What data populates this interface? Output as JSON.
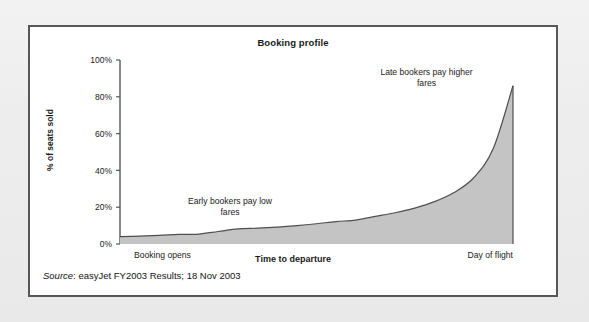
{
  "figure": {
    "title": "Booking profile",
    "source_label": "Source",
    "source_separator": ": ",
    "source_text": "easyJet FY2003 Results; 18 Nov 2003",
    "frame_color": "#555759",
    "background_color": "#ffffff",
    "page_background": "#ececec"
  },
  "chart_data": {
    "type": "area",
    "title": "Booking profile",
    "xlabel": "Time to departure",
    "ylabel": "% of seats sold",
    "ylim": [
      0,
      100
    ],
    "xlim": [
      0,
      100
    ],
    "grid": false,
    "legend": "none",
    "fill_color": "#c4c4c4",
    "line_color": "#4f4f4f",
    "axis_color": "#555759",
    "ytick_labels": [
      "0%",
      "20%",
      "40%",
      "60%",
      "80%",
      "100%"
    ],
    "ytick_values": [
      0,
      20,
      40,
      60,
      80,
      100
    ],
    "xtick_labels": [
      "Booking opens",
      "Day of flight"
    ],
    "xtick_positions": [
      0,
      100
    ],
    "x": [
      0,
      5,
      10,
      15,
      20,
      25,
      30,
      35,
      40,
      45,
      50,
      55,
      60,
      65,
      70,
      75,
      80,
      85,
      90,
      95,
      100
    ],
    "values": [
      4,
      4.3,
      4.7,
      5.2,
      5.4,
      6.8,
      8.2,
      8.6,
      9.2,
      10.0,
      11.0,
      12.2,
      13.0,
      15.0,
      17.0,
      19.5,
      23.0,
      28.0,
      36.0,
      52.0,
      86.0
    ],
    "series": [
      {
        "name": "% of seats sold",
        "values": [
          4,
          4.3,
          4.7,
          5.2,
          5.4,
          6.8,
          8.2,
          8.6,
          9.2,
          10.0,
          11.0,
          12.2,
          13.0,
          15.0,
          17.0,
          19.5,
          23.0,
          28.0,
          36.0,
          52.0,
          86.0
        ]
      }
    ],
    "annotations": [
      {
        "id": "early-bookers",
        "lines": [
          "Early bookers pay low",
          "fares"
        ],
        "x": 28,
        "y": 22
      },
      {
        "id": "late-bookers",
        "lines": [
          "Late bookers pay higher",
          "fares"
        ],
        "x": 78,
        "y": 92
      }
    ]
  }
}
